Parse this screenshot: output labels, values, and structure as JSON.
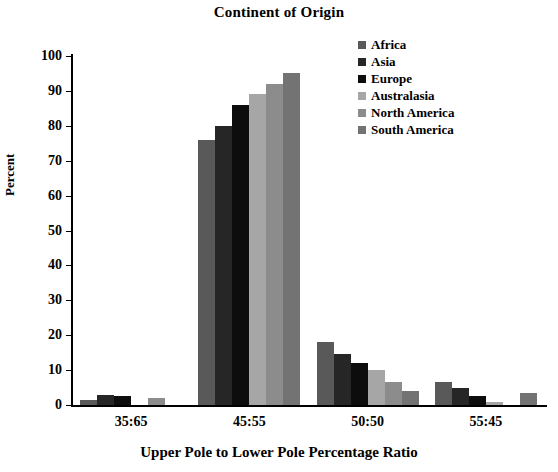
{
  "chart_data": {
    "type": "bar",
    "title": "Continent of Origin",
    "xlabel": "Upper Pole to Lower Pole Percentage Ratio",
    "ylabel": "Percent",
    "categories": [
      "35:65",
      "45:55",
      "50:50",
      "55:45"
    ],
    "ylim": [
      0,
      100
    ],
    "yticks": [
      0,
      10,
      20,
      30,
      40,
      50,
      60,
      70,
      80,
      90,
      100
    ],
    "grid": false,
    "legend_position": "top-right",
    "series": [
      {
        "name": "Africa",
        "color": "#595959",
        "values": [
          1.5,
          76,
          18,
          6.5
        ]
      },
      {
        "name": "Asia",
        "color": "#262626",
        "values": [
          3,
          80,
          14.5,
          5
        ]
      },
      {
        "name": "Europe",
        "color": "#0d0d0d",
        "values": [
          2.5,
          86,
          12,
          2.5
        ]
      },
      {
        "name": "Australasia",
        "color": "#a6a6a6",
        "values": [
          0,
          89,
          10,
          1
        ]
      },
      {
        "name": "North America",
        "color": "#8c8c8c",
        "values": [
          2,
          92,
          6.5,
          0
        ]
      },
      {
        "name": "South America",
        "color": "#737373",
        "values": [
          0,
          95,
          4,
          3.5
        ]
      }
    ]
  },
  "legend": {
    "items": [
      {
        "label": "Africa"
      },
      {
        "label": "Asia"
      },
      {
        "label": "Europe"
      },
      {
        "label": "Australasia"
      },
      {
        "label": "North America"
      },
      {
        "label": "South America"
      }
    ]
  }
}
